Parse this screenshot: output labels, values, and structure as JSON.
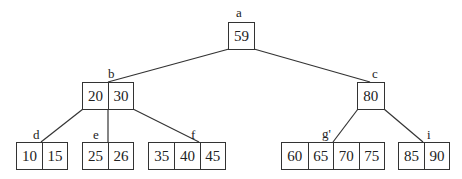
{
  "diagram": {
    "type": "B-tree",
    "nodes": {
      "a": {
        "label": "a",
        "keys": [
          "59"
        ]
      },
      "b": {
        "label": "b",
        "keys": [
          "20",
          "30"
        ]
      },
      "c": {
        "label": "c",
        "keys": [
          "80"
        ]
      },
      "d": {
        "label": "d",
        "keys": [
          "10",
          "15"
        ]
      },
      "e": {
        "label": "e",
        "keys": [
          "25",
          "26"
        ]
      },
      "f": {
        "label": "f",
        "keys": [
          "35",
          "40",
          "45"
        ]
      },
      "g": {
        "label": "g'",
        "keys": [
          "60",
          "65",
          "70",
          "75"
        ]
      },
      "i": {
        "label": "i",
        "keys": [
          "85",
          "90"
        ]
      }
    },
    "edges": [
      [
        "a",
        "b"
      ],
      [
        "a",
        "c"
      ],
      [
        "b",
        "d"
      ],
      [
        "b",
        "e"
      ],
      [
        "b",
        "f"
      ],
      [
        "c",
        "g"
      ],
      [
        "c",
        "i"
      ]
    ]
  }
}
